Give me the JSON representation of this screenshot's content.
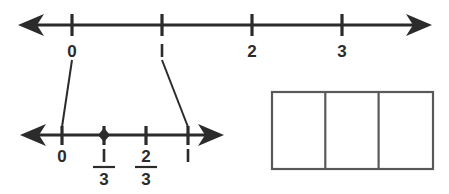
{
  "figure": {
    "ink_color": "#2b2b2b",
    "shade_color": "#d8d8d8",
    "box_stroke_color": "#595959"
  },
  "top_number_line": {
    "name": "whole-number-line",
    "labels": [
      "0",
      "1",
      "2",
      "3"
    ],
    "tick_values": [
      0,
      1,
      2,
      3
    ],
    "tick_x": [
      72,
      162,
      252,
      342
    ],
    "axis_y": 25,
    "left_arrow": true,
    "right_arrow": true,
    "line_start_x": 20,
    "line_end_x": 430
  },
  "bottom_number_line": {
    "name": "thirds-number-line",
    "axis_y": 135,
    "line_start_x": 22,
    "line_end_x": 222,
    "left_arrow": true,
    "right_arrow": true,
    "tick_x": [
      62,
      104,
      146,
      188
    ],
    "ticks": [
      {
        "label_numerator": "0",
        "label_denominator": "",
        "is_fraction": false,
        "marked": false
      },
      {
        "label_numerator": "1",
        "label_denominator": "3",
        "is_fraction": true,
        "marked": true
      },
      {
        "label_numerator": "2",
        "label_denominator": "3",
        "is_fraction": true,
        "marked": false
      },
      {
        "label_numerator": "1",
        "label_denominator": "",
        "is_fraction": false,
        "marked": false
      }
    ],
    "marked_point_value": "1/3"
  },
  "connectors": [
    {
      "name": "connector-zero",
      "from_x": 72,
      "from_y": 58,
      "to_x": 62,
      "to_y": 128
    },
    {
      "name": "connector-one",
      "from_x": 162,
      "from_y": 58,
      "to_x": 188,
      "to_y": 128
    }
  ],
  "rectangle_model": {
    "name": "thirds-area-model",
    "x": 271,
    "y": 91,
    "width": 163,
    "height": 79,
    "parts": 3,
    "shaded_parts": 1,
    "fraction_shown": "1/3"
  }
}
